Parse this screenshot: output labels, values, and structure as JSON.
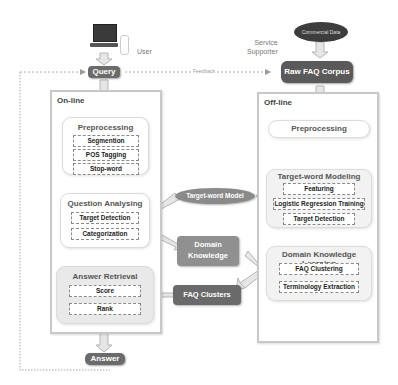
{
  "top": {
    "user_label": "User",
    "query_label": "Query",
    "feedback_label": "Feedback",
    "service_label_line1": "Service",
    "service_label_line2": "Supporter",
    "commercial_label": "Commercial Data",
    "raw_corpus_label": "Raw FAQ Corpus"
  },
  "online": {
    "title": "On-line",
    "preprocessing": {
      "title": "Preprocessing",
      "steps": [
        "Segmention",
        "POS Tagging",
        "Stop-word"
      ]
    },
    "question_analysing": {
      "title": "Question Analysing",
      "steps": [
        "Target Detection",
        "Categorization"
      ]
    },
    "answer_retrieval": {
      "title": "Answer Retrieval",
      "steps": [
        "Score",
        "Rank"
      ]
    }
  },
  "offline": {
    "title": "Off-line",
    "preprocessing": {
      "title": "Preprocessing"
    },
    "target_word_modeling": {
      "title": "Target-word Modeling",
      "steps": [
        "Featuring",
        "Logistic Regression Training",
        "Target Detection"
      ]
    },
    "domain_knowledge_learning": {
      "title": "Domain Knowledge Learning",
      "steps": [
        "FAQ Clustering",
        "Terminology Extraction"
      ]
    }
  },
  "middle": {
    "target_word_model": "Target-word Model",
    "domain_knowledge_line1": "Domain",
    "domain_knowledge_line2": "Knowledge",
    "faq_clusters": "FAQ Clusters"
  },
  "bottom": {
    "answer_label": "Answer"
  },
  "colors": {
    "dark_node": "#6b6b6b",
    "mid_node": "#8a8a8a",
    "panel_border": "#c8c8c8",
    "module_fill": "#f2f2f2",
    "arrow_fill": "#e6e6e6",
    "arrow_stroke": "#b5b5b5"
  }
}
